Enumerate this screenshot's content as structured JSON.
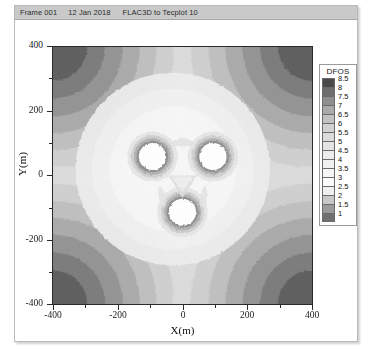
{
  "window": {
    "title_bar": {
      "frame": "Frame 001",
      "date": "12 Jan 2018",
      "source": "FLAC3D to Tecplot 10"
    }
  },
  "legend": {
    "title": "DFOS",
    "levels": [
      8.5,
      8,
      7.5,
      7,
      6.5,
      6,
      5.5,
      5,
      4.5,
      4,
      3.5,
      3,
      2.5,
      2,
      1.5,
      1
    ],
    "colors": [
      "#4a4a4a",
      "#6e6e6e",
      "#8e8e8e",
      "#aaaaaa",
      "#c2c2c2",
      "#d2d2d2",
      "#dcdcdc",
      "#e4e4e4",
      "#ececec",
      "#f1f1f1",
      "#f6f6f6",
      "#fbfbfb",
      "#f0f0f0",
      "#c8c8c8",
      "#9a9a9a",
      "#707070"
    ]
  },
  "chart_data": {
    "type": "heatmap",
    "xlabel": "X(m)",
    "ylabel": "Y(m)",
    "xlim": [
      -400,
      400
    ],
    "ylim": [
      -400,
      400
    ],
    "xticks": [
      -400,
      -200,
      0,
      200,
      400
    ],
    "yticks": [
      -400,
      -200,
      0,
      200,
      400
    ],
    "xtick_labels": [
      "-400",
      "-200",
      "0",
      "200",
      "400"
    ],
    "ytick_labels": [
      "-400",
      "-200",
      "0",
      "200",
      "400"
    ],
    "grid": false,
    "legend_position": "right-outside",
    "variable": "DFOS",
    "value_range": [
      1,
      8.5
    ],
    "contour_interval": 0.5,
    "background_value": 3,
    "features": {
      "openings": [
        {
          "name": "left-tunnel",
          "center_m": [
            -185,
            45
          ],
          "radius_m": 43
        },
        {
          "name": "right-tunnel",
          "center_m": [
            0,
            45
          ],
          "radius_m": 43
        },
        {
          "name": "bottom-tunnel",
          "center_m": [
            -90,
            -125
          ],
          "radius_m": 43
        }
      ],
      "corner_bands": [
        {
          "corner": "top-left",
          "values": [
            8.5,
            8,
            7.5,
            7,
            6.5,
            6,
            5.5
          ]
        },
        {
          "corner": "top-right",
          "values": [
            8.5,
            8,
            7.5,
            7,
            6.5,
            6,
            5.5
          ]
        },
        {
          "corner": "bottom-left",
          "values": [
            8.5,
            8,
            7.5,
            7,
            6.5,
            6,
            5.5
          ]
        },
        {
          "corner": "bottom-right",
          "values": [
            8.5,
            8,
            7.5,
            7,
            6.5,
            6,
            5.5
          ]
        }
      ],
      "opening_ring_values": [
        2.5,
        2,
        1.5,
        1
      ]
    }
  },
  "axes": {
    "y_title": "Y(m)",
    "x_title": "X(m)"
  }
}
